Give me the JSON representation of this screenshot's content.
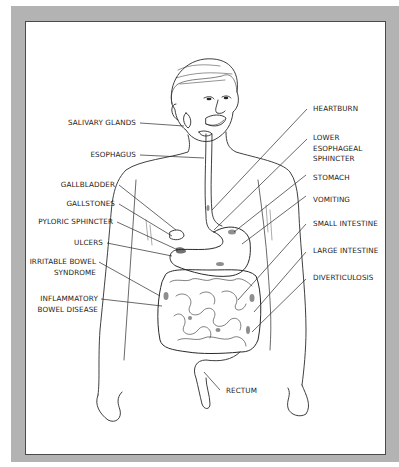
{
  "figure": {
    "colors": {
      "frame": "#b3b3b3",
      "panel": "#ffffff",
      "ink": "#222222"
    }
  },
  "labels_left": [
    {
      "id": "salivary-glands",
      "text": "SALIVARY GLANDS"
    },
    {
      "id": "esophagus",
      "text": "ESOPHAGUS"
    },
    {
      "id": "gallbladder",
      "text": "GALLBLADDER"
    },
    {
      "id": "gallstones",
      "text": "GALLSTONES"
    },
    {
      "id": "pyloric-sphincter",
      "text": "PYLORIC SPHINCTER"
    },
    {
      "id": "ulcers",
      "text": "ULCERS"
    },
    {
      "id": "irritable-bowel-syndrome",
      "line1": "IRRITABLE BOWEL",
      "line2": "SYNDROME"
    },
    {
      "id": "inflammatory-bowel-disease",
      "line1": "INFLAMMATORY",
      "line2": "BOWEL DISEASE"
    }
  ],
  "labels_right": [
    {
      "id": "heartburn",
      "text": "HEARTBURN"
    },
    {
      "id": "lower-esophageal-sphincter",
      "line1": "LOWER",
      "line2": "ESOPHAGEAL",
      "line3": "SPHINCTER"
    },
    {
      "id": "stomach",
      "text": "STOMACH"
    },
    {
      "id": "vomiting",
      "text": "VOMITING"
    },
    {
      "id": "small-intestine",
      "text": "SMALL INTESTINE"
    },
    {
      "id": "large-intestine",
      "text": "LARGE INTESTINE"
    },
    {
      "id": "diverticulosis",
      "text": "DIVERTICULOSIS"
    }
  ],
  "labels_bottom": [
    {
      "id": "rectum",
      "text": "RECTUM"
    }
  ]
}
